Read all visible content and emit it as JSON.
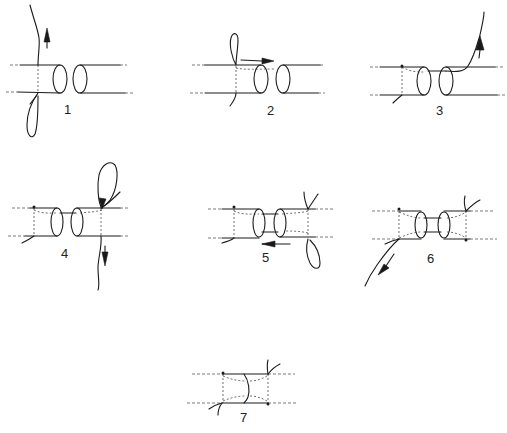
{
  "figure": {
    "steps": [
      {
        "label": "1",
        "x": 64,
        "y": 102
      },
      {
        "label": "2",
        "x": 267,
        "y": 103
      },
      {
        "label": "3",
        "x": 436,
        "y": 103
      },
      {
        "label": "4",
        "x": 61,
        "y": 246
      },
      {
        "label": "5",
        "x": 262,
        "y": 250
      },
      {
        "label": "6",
        "x": 427,
        "y": 251
      },
      {
        "label": "7",
        "x": 240,
        "y": 410
      }
    ],
    "colors": {
      "line": "#1a1a1a",
      "background": "#ffffff"
    }
  }
}
